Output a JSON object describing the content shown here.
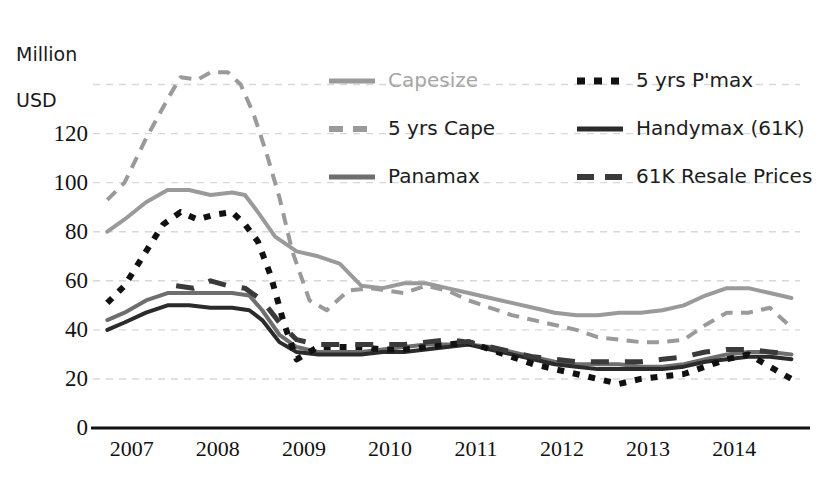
{
  "chart_data": {
    "type": "line",
    "title": "",
    "subtitle": "",
    "ylabel": "Million\nUSD",
    "xlabel": "",
    "ylim": [
      0,
      150
    ],
    "yticks": [
      0,
      20,
      40,
      60,
      80,
      100,
      120
    ],
    "ytick_labels": [
      "0",
      "20",
      "40",
      "60",
      "80",
      "100",
      "120"
    ],
    "gridlines": [
      20,
      40,
      60,
      80,
      100,
      120,
      140
    ],
    "grid": true,
    "legend_position": "top-right",
    "xlim": [
      2006.7,
      2014.8
    ],
    "xticks": [
      2007,
      2008,
      2009,
      2010,
      2011,
      2012,
      2013,
      2014
    ],
    "xtick_labels": [
      "2007",
      "2008",
      "2009",
      "2010",
      "2011",
      "2012",
      "2013",
      "2014"
    ],
    "series": [
      {
        "name": "Capesize",
        "color": "#9a9a9a",
        "style": "solid",
        "width": 4,
        "x": [
          2006.75,
          2006.95,
          2007.2,
          2007.45,
          2007.7,
          2007.95,
          2008.2,
          2008.35,
          2008.5,
          2008.7,
          2008.95,
          2009.2,
          2009.45,
          2009.7,
          2009.95,
          2010.2,
          2010.45,
          2010.7,
          2010.95,
          2011.2,
          2011.45,
          2011.7,
          2011.95,
          2012.2,
          2012.45,
          2012.7,
          2012.95,
          2013.2,
          2013.45,
          2013.7,
          2013.95,
          2014.2,
          2014.45,
          2014.7
        ],
        "y": [
          80,
          85,
          92,
          97,
          97,
          95,
          96,
          95,
          88,
          78,
          72,
          70,
          67,
          58,
          57,
          59,
          59,
          57,
          55,
          53,
          51,
          49,
          47,
          46,
          46,
          47,
          47,
          48,
          50,
          54,
          57,
          57,
          55,
          53
        ]
      },
      {
        "name": "5 yrs Cape",
        "color": "#9a9a9a",
        "style": "dashed",
        "width": 4,
        "x": [
          2006.75,
          2006.95,
          2007.2,
          2007.45,
          2007.6,
          2007.8,
          2007.95,
          2008.15,
          2008.3,
          2008.45,
          2008.6,
          2008.75,
          2008.9,
          2009.1,
          2009.3,
          2009.55,
          2009.8,
          2010.0,
          2010.2,
          2010.45,
          2010.7,
          2010.95,
          2011.2,
          2011.45,
          2011.7,
          2011.95,
          2012.2,
          2012.45,
          2012.7,
          2012.95,
          2013.2,
          2013.45,
          2013.7,
          2013.95,
          2014.2,
          2014.45,
          2014.7
        ],
        "y": [
          93,
          100,
          118,
          134,
          143,
          142,
          145,
          145,
          140,
          128,
          112,
          94,
          72,
          52,
          48,
          56,
          57,
          56,
          55,
          58,
          56,
          52,
          49,
          46,
          44,
          42,
          40,
          37,
          36,
          35,
          35,
          36,
          42,
          47,
          47,
          49,
          41
        ]
      },
      {
        "name": "Panamax",
        "color": "#6e6e6e",
        "style": "solid",
        "width": 4,
        "x": [
          2006.75,
          2006.95,
          2007.2,
          2007.45,
          2007.7,
          2007.95,
          2008.2,
          2008.4,
          2008.55,
          2008.75,
          2008.95,
          2009.2,
          2009.45,
          2009.7,
          2009.95,
          2010.2,
          2010.45,
          2010.7,
          2010.95,
          2011.2,
          2011.45,
          2011.7,
          2011.95,
          2012.2,
          2012.45,
          2012.7,
          2012.95,
          2013.2,
          2013.45,
          2013.7,
          2013.95,
          2014.2,
          2014.45,
          2014.7
        ],
        "y": [
          44,
          47,
          52,
          55,
          55,
          55,
          55,
          54,
          48,
          38,
          33,
          31,
          31,
          31,
          32,
          33,
          34,
          34,
          34,
          33,
          31,
          29,
          27,
          26,
          26,
          26,
          25,
          25,
          26,
          28,
          30,
          31,
          31,
          30
        ]
      },
      {
        "name": "Handymax (61K)",
        "color": "#2b2b2b",
        "style": "solid",
        "width": 4,
        "x": [
          2006.75,
          2006.95,
          2007.2,
          2007.45,
          2007.7,
          2007.95,
          2008.2,
          2008.4,
          2008.55,
          2008.75,
          2008.95,
          2009.2,
          2009.45,
          2009.7,
          2009.95,
          2010.2,
          2010.45,
          2010.7,
          2010.95,
          2011.2,
          2011.45,
          2011.7,
          2011.95,
          2012.2,
          2012.45,
          2012.7,
          2012.95,
          2013.2,
          2013.45,
          2013.7,
          2013.95,
          2014.2,
          2014.45,
          2014.7
        ],
        "y": [
          40,
          43,
          47,
          50,
          50,
          49,
          49,
          48,
          44,
          35,
          31,
          30,
          30,
          30,
          31,
          31,
          32,
          33,
          34,
          32,
          30,
          28,
          26,
          25,
          24,
          24,
          24,
          24,
          25,
          27,
          28,
          29,
          29,
          28
        ]
      },
      {
        "name": "5 yrs P'max",
        "color": "#111111",
        "style": "dotted",
        "width": 6,
        "x": [
          2006.75,
          2006.95,
          2007.2,
          2007.4,
          2007.6,
          2007.8,
          2008.0,
          2008.2,
          2008.35,
          2008.5,
          2008.65,
          2008.8,
          2008.95,
          2009.2,
          2009.45,
          2009.7,
          2009.95,
          2010.2,
          2010.45,
          2010.7,
          2010.95,
          2011.2,
          2011.45,
          2011.7,
          2011.95,
          2012.2,
          2012.45,
          2012.7,
          2012.95,
          2013.2,
          2013.45,
          2013.7,
          2013.95,
          2014.2,
          2014.45,
          2014.7
        ],
        "y": [
          51,
          58,
          72,
          83,
          88,
          85,
          87,
          88,
          83,
          76,
          62,
          43,
          28,
          33,
          33,
          33,
          32,
          32,
          33,
          34,
          35,
          32,
          29,
          26,
          24,
          22,
          20,
          18,
          20,
          21,
          22,
          25,
          28,
          30,
          25,
          20
        ]
      },
      {
        "name": "61K Resale Prices",
        "color": "#3a3a3a",
        "style": "longdash",
        "width": 5,
        "x": [
          2007.55,
          2007.75,
          2007.95,
          2008.15,
          2008.35,
          2008.55,
          2008.75,
          2008.95,
          2009.2,
          2009.45,
          2009.7,
          2009.95,
          2010.2,
          2010.45,
          2010.7,
          2010.95,
          2011.2,
          2011.45,
          2011.7,
          2011.95,
          2012.2,
          2012.45,
          2012.7,
          2012.95,
          2013.2,
          2013.45,
          2013.7,
          2013.95,
          2014.2,
          2014.45,
          2014.7
        ],
        "y": [
          58,
          57,
          60,
          58,
          57,
          52,
          43,
          36,
          34,
          34,
          34,
          34,
          34,
          35,
          36,
          35,
          33,
          31,
          29,
          28,
          27,
          27,
          27,
          27,
          28,
          29,
          31,
          32,
          32,
          31,
          30
        ]
      }
    ]
  },
  "legend": {
    "items": [
      {
        "label": "Capesize",
        "series": "Capesize",
        "color": "#9a9a9a",
        "style": "solid",
        "muted": true
      },
      {
        "label": "5 yrs P'max",
        "series": "5 yrs P'max",
        "color": "#111111",
        "style": "dotted",
        "muted": false
      },
      {
        "label": "5 yrs Cape",
        "series": "5 yrs Cape",
        "color": "#9a9a9a",
        "style": "dashed",
        "muted": false
      },
      {
        "label": "Handymax (61K)",
        "series": "Handymax (61K)",
        "color": "#2b2b2b",
        "style": "solid",
        "muted": false
      },
      {
        "label": "Panamax",
        "series": "Panamax",
        "color": "#6e6e6e",
        "style": "solid",
        "muted": false
      },
      {
        "label": "61K Resale Prices",
        "series": "61K Resale Prices",
        "color": "#3a3a3a",
        "style": "longdash",
        "muted": false
      }
    ]
  },
  "axis": {
    "unit_line1": "Million",
    "unit_line2": "USD"
  },
  "colors": {
    "background": "#ffffff",
    "grid": "#d8d8d8",
    "axis": "#111111",
    "text": "#111111"
  }
}
